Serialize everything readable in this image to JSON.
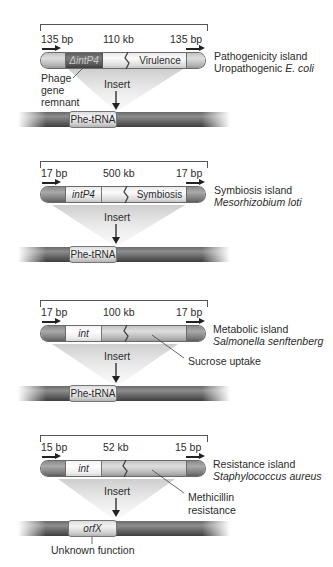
{
  "figure": {
    "panels": [
      {
        "left_repeat": "135 bp",
        "island_size": "110 kb",
        "right_repeat": "135 bp",
        "integrase_label": "ΔintP4",
        "gene_label": "Virulence",
        "island_type": "Pathogenicity island",
        "organism_prefix": "Uropathogenic ",
        "organism_italic": "E. coli",
        "remnant_label_1": "Phage",
        "remnant_label_2": "gene",
        "remnant_label_3": "remnant",
        "insert_label": "Insert",
        "site_label": "Phe-tRNA"
      },
      {
        "left_repeat": "17 bp",
        "island_size": "500 kb",
        "right_repeat": "17 bp",
        "integrase_label": "intP4",
        "gene_label": "Symbiosis",
        "island_type": "Symbiosis island",
        "organism_italic": "Mesorhizobium loti",
        "insert_label": "Insert",
        "site_label": "Phe-tRNA"
      },
      {
        "left_repeat": "17 bp",
        "island_size": "100 kb",
        "right_repeat": "17 bp",
        "integrase_label": "int",
        "island_type": "Metabolic island",
        "organism_italic": "Salmonella senftenberg",
        "callout": "Sucrose uptake",
        "insert_label": "Insert",
        "site_label": "Phe-tRNA"
      },
      {
        "left_repeat": "15 bp",
        "island_size": "52 kb",
        "right_repeat": "15 bp",
        "integrase_label": "int",
        "island_type": "Resistance island",
        "organism_italic": "Staphylococcus aureus",
        "callout_1": "Methicillin",
        "callout_2": "resistance",
        "insert_label": "Insert",
        "site_label": "orfX",
        "site_note": "Unknown function"
      }
    ]
  }
}
